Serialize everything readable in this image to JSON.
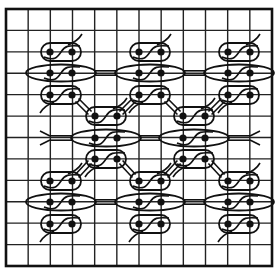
{
  "diagram": {
    "title": "",
    "colors": {
      "background": "#ffffff",
      "grid": "#222222",
      "ink": "#111111"
    },
    "grid": {
      "columns": 12,
      "rows": 12,
      "left": 6,
      "top": 9,
      "right": 272,
      "bottom": 266
    },
    "clusters": [
      {
        "id": "top-left",
        "x": [
          50,
          72
        ],
        "y": [
          52,
          73,
          95
        ]
      },
      {
        "id": "top-center",
        "x": [
          139,
          161
        ],
        "y": [
          52,
          73,
          95
        ]
      },
      {
        "id": "top-right",
        "x": [
          228,
          250
        ],
        "y": [
          52,
          73,
          95
        ]
      },
      {
        "id": "middle-left",
        "x": [
          95,
          117
        ],
        "y": [
          116,
          138,
          159
        ]
      },
      {
        "id": "middle-right",
        "x": [
          183,
          205
        ],
        "y": [
          116,
          138,
          159
        ]
      },
      {
        "id": "bottom-left",
        "x": [
          50,
          72
        ],
        "y": [
          181,
          202,
          224
        ]
      },
      {
        "id": "bottom-center",
        "x": [
          139,
          161
        ],
        "y": [
          181,
          202,
          224
        ]
      },
      {
        "id": "bottom-right",
        "x": [
          228,
          250
        ],
        "y": [
          181,
          202,
          224
        ]
      }
    ],
    "double_bonds": [
      {
        "from": [
          94,
          73
        ],
        "to": [
          117,
          73
        ]
      },
      {
        "from": [
          183,
          73
        ],
        "to": [
          206,
          73
        ]
      },
      {
        "from": [
          50,
          138
        ],
        "to": [
          73,
          138
        ]
      },
      {
        "from": [
          139,
          138
        ],
        "to": [
          161,
          138
        ]
      },
      {
        "from": [
          227,
          138
        ],
        "to": [
          250,
          138
        ]
      },
      {
        "from": [
          94,
          202
        ],
        "to": [
          117,
          202
        ]
      },
      {
        "from": [
          183,
          202
        ],
        "to": [
          206,
          202
        ]
      },
      {
        "from": [
          77,
          100
        ],
        "to": [
          90,
          113
        ]
      },
      {
        "from": [
          134,
          100
        ],
        "to": [
          121,
          113
        ]
      },
      {
        "from": [
          166,
          100
        ],
        "to": [
          179,
          113
        ]
      },
      {
        "from": [
          223,
          100
        ],
        "to": [
          210,
          113
        ]
      },
      {
        "from": [
          90,
          162
        ],
        "to": [
          77,
          176
        ]
      },
      {
        "from": [
          121,
          162
        ],
        "to": [
          134,
          176
        ]
      },
      {
        "from": [
          179,
          162
        ],
        "to": [
          166,
          176
        ]
      },
      {
        "from": [
          210,
          162
        ],
        "to": [
          223,
          176
        ]
      }
    ]
  }
}
